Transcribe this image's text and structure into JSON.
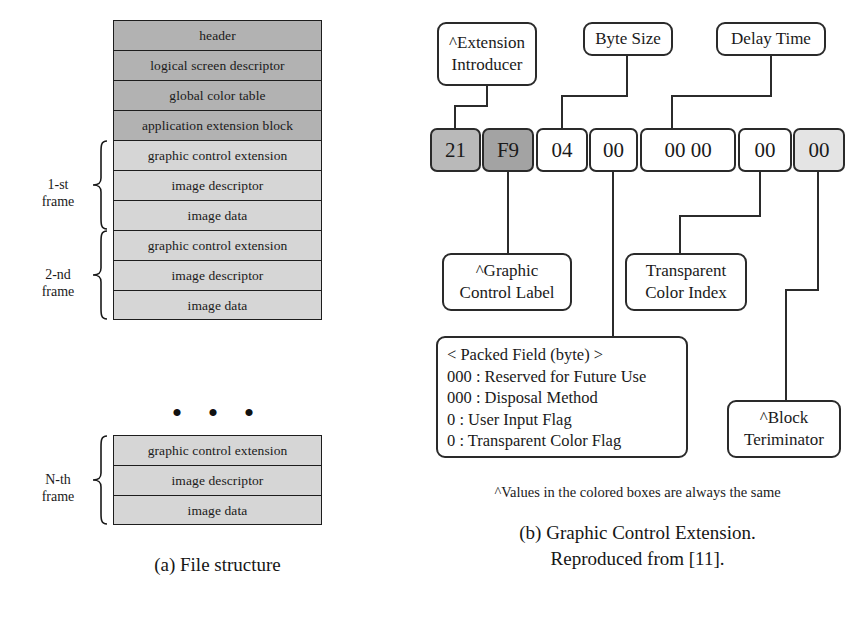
{
  "figure_a": {
    "caption": "(a) File structure",
    "ellipsis": "• • •",
    "header_rows": [
      {
        "label": "header"
      },
      {
        "label": "logical screen descriptor"
      },
      {
        "label": "global color table"
      },
      {
        "label": "application extension block"
      }
    ],
    "frames": [
      {
        "label_line1": "1-st",
        "label_line2": "frame",
        "rows": [
          {
            "label": "graphic control extension"
          },
          {
            "label": "image descriptor"
          },
          {
            "label": "image data"
          }
        ]
      },
      {
        "label_line1": "2-nd",
        "label_line2": "frame",
        "rows": [
          {
            "label": "graphic control extension"
          },
          {
            "label": "image descriptor"
          },
          {
            "label": "image data"
          }
        ]
      },
      {
        "label_line1": "N-th",
        "label_line2": "frame",
        "rows": [
          {
            "label": "graphic control extension"
          },
          {
            "label": "image descriptor"
          },
          {
            "label": "image data"
          }
        ]
      }
    ],
    "colors": {
      "header_fill": "#b2b2b2",
      "frame_fill": "#d6d6d6",
      "border": "#1d1d1d"
    }
  },
  "figure_b": {
    "caption_line1": "(b) Graphic Control Extension.",
    "caption_line2": "Reproduced from [11].",
    "footnote": "^Values in the colored boxes are always the same",
    "bytes": [
      {
        "value": "21",
        "tone": "tone-mid"
      },
      {
        "value": "F9",
        "tone": "tone-dark"
      },
      {
        "value": "04",
        "tone": ""
      },
      {
        "value": "00",
        "tone": ""
      },
      {
        "value": "00 00",
        "tone": ""
      },
      {
        "value": "00",
        "tone": ""
      },
      {
        "value": "00",
        "tone": "tone-light"
      }
    ],
    "callouts": {
      "extension_introducer": {
        "line1": "^Extension",
        "line2": "Introducer"
      },
      "byte_size": {
        "line1": "Byte Size"
      },
      "delay_time": {
        "line1": "Delay Time"
      },
      "graphic_control_label": {
        "line1": "^Graphic",
        "line2": "Control Label"
      },
      "transparent_color_index": {
        "line1": "Transparent",
        "line2": "Color Index"
      },
      "block_terminator": {
        "line1": "^Block",
        "line2": "Teriminator"
      }
    },
    "packed_field": {
      "title": "< Packed Field (byte) >",
      "lines": [
        "000 : Reserved for Future Use",
        "000 : Disposal Method",
        "0 : User Input Flag",
        "0 : Transparent Color Flag"
      ]
    },
    "colors": {
      "box_border": "#2a2a2a",
      "tone_mid": "#b9b9b9",
      "tone_dark": "#a3a3a3",
      "tone_light": "#e4e4e4"
    }
  }
}
